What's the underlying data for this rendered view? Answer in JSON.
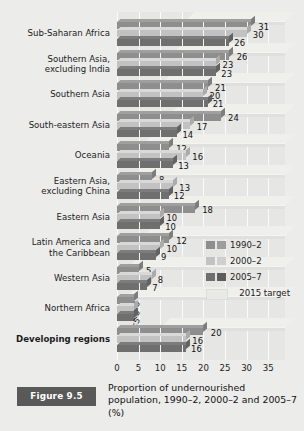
{
  "figure": {
    "tag": "Figure 9.5",
    "caption": "Proportion of undernourished population, 1990–2, 2000–2 and 2005–7 (%)"
  },
  "legend": {
    "position": "inside-right",
    "items": [
      {
        "label": "1990–2",
        "color": "#8e8e8e",
        "color2": "#9d9d9d",
        "type": "swatch-pair"
      },
      {
        "label": "2000–2",
        "color": "#c2c2c2",
        "color2": "#cfcfcf",
        "type": "swatch-pair"
      },
      {
        "label": "2005–7",
        "color": "#6f6f6f",
        "color2": "#5d5d5d",
        "type": "swatch-pair"
      },
      {
        "label": "2015 target",
        "color": "#e9e9e6",
        "color2": "#e9e9e6",
        "type": "band"
      }
    ]
  },
  "chart_data": {
    "type": "bar",
    "orientation": "horizontal",
    "title": "Proportion of undernourished population, 1990–2, 2000–2 and 2005–7 (%)",
    "xlabel": "",
    "ylabel": "",
    "xlim": [
      0,
      35
    ],
    "xticks": [
      0,
      5,
      10,
      15,
      20,
      25,
      30,
      35
    ],
    "grid": true,
    "grid_axis": "x",
    "categories": [
      "Sub-Saharan Africa",
      "Southern Asia, excluding India",
      "Southern Asia",
      "South-eastern Asia",
      "Oceania",
      "Eastern Asia, excluding China",
      "Eastern Asia",
      "Latin America and the Caribbean",
      "Western Asia",
      "Northern Africa",
      "Developing regions"
    ],
    "series": [
      {
        "name": "1990–2",
        "color": "#8e8e8e",
        "values": [
          31,
          26,
          21,
          24,
          12,
          8,
          18,
          12,
          5,
          4,
          20
        ],
        "labels": [
          "31",
          "26",
          "21",
          "24",
          "12",
          "8",
          "18",
          "12",
          "5",
          "<5",
          "20"
        ]
      },
      {
        "name": "2000–2",
        "color": "#c2c2c2",
        "values": [
          30,
          23,
          20,
          17,
          16,
          13,
          10,
          10,
          8,
          4,
          16
        ],
        "labels": [
          "30",
          "23",
          "20",
          "17",
          "16",
          "13",
          "10",
          "10",
          "8",
          "<5",
          "16"
        ]
      },
      {
        "name": "2005–7",
        "color": "#6f6f6f",
        "values": [
          26,
          23,
          21,
          14,
          13,
          12,
          10,
          9,
          7,
          4,
          16
        ],
        "labels": [
          "26",
          "23",
          "21",
          "14",
          "13",
          "12",
          "10",
          "9",
          "7",
          "<5",
          "16"
        ]
      }
    ],
    "target_series": {
      "name": "2015 target",
      "color": "#e9e9e6",
      "values": [
        15.5,
        13,
        10.5,
        12,
        6,
        4,
        9,
        6,
        2.5,
        2,
        10
      ]
    }
  },
  "axis": {
    "ticks": [
      "0",
      "5",
      "10",
      "15",
      "20",
      "25",
      "30",
      "35"
    ]
  },
  "labels": {
    "rows": [
      "Sub-Saharan Africa",
      "Southern Asia,\nexcluding India",
      "Southern Asia",
      "South-eastern Asia",
      "Oceania",
      "Eastern Asia,\nexcluding China",
      "Eastern Asia",
      "Latin America and\nthe Caribbean",
      "Western Asia",
      "Northern Africa",
      "Developing regions"
    ]
  },
  "colors": {
    "background": "#ececeb",
    "panel": "#e6e6e4",
    "gridline": "#fbfbfa",
    "series1": "#8e8e8e",
    "series2": "#c2c2c2",
    "series3": "#6f6f6f",
    "target": "#e9e9e6",
    "tag_bg": "#595959",
    "tag_fg": "#ffffff",
    "text": "#1b1b1b"
  }
}
